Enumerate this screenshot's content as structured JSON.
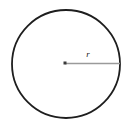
{
  "figure": {
    "kind": "geometry-diagram",
    "canvas": {
      "width": 132,
      "height": 130,
      "background_color": "#ffffff"
    },
    "circle": {
      "name": "circle-outline",
      "center_x": 66,
      "center_y": 64,
      "radius": 54,
      "stroke_color": "#1e1e1e",
      "stroke_width": 1.8,
      "fill": "none"
    },
    "center_point": {
      "name": "center-dot",
      "x": 65,
      "y": 63,
      "size": 3,
      "color": "#3a3a3a",
      "shape": "square"
    },
    "radius_segment": {
      "name": "radius-line",
      "x1": 65,
      "y1": 63.5,
      "x2": 120,
      "y2": 63.5,
      "stroke_color": "#9a9a9a",
      "stroke_width": 1.6
    },
    "radius_label": {
      "text": "r",
      "x": 88,
      "y": 57,
      "color": "#1b1b1b",
      "font_size": 9,
      "style": "italic"
    }
  }
}
